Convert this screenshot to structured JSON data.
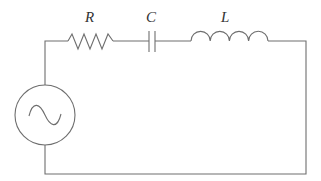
{
  "diagram": {
    "type": "series RLC circuit",
    "components": [
      {
        "id": "source",
        "kind": "ac-voltage-source",
        "label": ""
      },
      {
        "id": "resistor",
        "kind": "resistor",
        "label": "R"
      },
      {
        "id": "capacitor",
        "kind": "capacitor",
        "label": "C"
      },
      {
        "id": "inductor",
        "kind": "inductor",
        "label": "L"
      }
    ],
    "connection_order": [
      "source",
      "resistor",
      "capacitor",
      "inductor",
      "source"
    ],
    "colors": {
      "wire": "#6e6e6e",
      "label": "#333333",
      "background": "#ffffff"
    }
  }
}
